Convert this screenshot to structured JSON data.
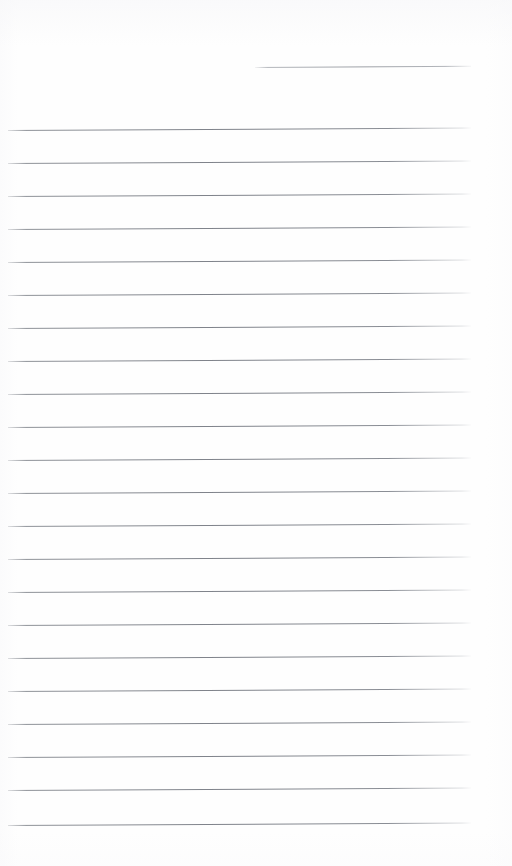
{
  "document": {
    "type": "lined-notebook-page",
    "title": "Blank ruled notebook page",
    "description": "Scanned blank lined paper with horizontal ruling lines and no written content",
    "page_width": 512,
    "page_height": 866,
    "background_color": "#fefefe",
    "rule_color": "#82868e",
    "rule_thickness_px": 1,
    "rule_spacing_px": 33,
    "left_margin_px": 8,
    "right_margin_px": 41,
    "top_margin_px": 67,
    "bottom_margin_px": 41,
    "skew_degrees": -0.3,
    "text_content": "",
    "rule_count": 24,
    "rules": [
      {
        "index": 1,
        "y": 67,
        "x_start": 255,
        "x_end": 471,
        "partial": true
      },
      {
        "index": 2,
        "y": 130,
        "x_start": 8,
        "x_end": 471,
        "partial": false
      },
      {
        "index": 3,
        "y": 163,
        "x_start": 8,
        "x_end": 471,
        "partial": false
      },
      {
        "index": 4,
        "y": 196,
        "x_start": 8,
        "x_end": 471,
        "partial": false
      },
      {
        "index": 5,
        "y": 229,
        "x_start": 8,
        "x_end": 471,
        "partial": false
      },
      {
        "index": 6,
        "y": 262,
        "x_start": 8,
        "x_end": 471,
        "partial": false
      },
      {
        "index": 7,
        "y": 295,
        "x_start": 8,
        "x_end": 471,
        "partial": false
      },
      {
        "index": 8,
        "y": 328,
        "x_start": 8,
        "x_end": 471,
        "partial": false
      },
      {
        "index": 9,
        "y": 361,
        "x_start": 8,
        "x_end": 471,
        "partial": false
      },
      {
        "index": 10,
        "y": 394,
        "x_start": 8,
        "x_end": 471,
        "partial": false
      },
      {
        "index": 11,
        "y": 427,
        "x_start": 8,
        "x_end": 471,
        "partial": false
      },
      {
        "index": 12,
        "y": 460,
        "x_start": 8,
        "x_end": 471,
        "partial": false
      },
      {
        "index": 13,
        "y": 493,
        "x_start": 8,
        "x_end": 471,
        "partial": false
      },
      {
        "index": 14,
        "y": 526,
        "x_start": 8,
        "x_end": 471,
        "partial": false
      },
      {
        "index": 15,
        "y": 559,
        "x_start": 8,
        "x_end": 471,
        "partial": false
      },
      {
        "index": 16,
        "y": 592,
        "x_start": 8,
        "x_end": 471,
        "partial": false
      },
      {
        "index": 17,
        "y": 625,
        "x_start": 8,
        "x_end": 471,
        "partial": false
      },
      {
        "index": 18,
        "y": 658,
        "x_start": 8,
        "x_end": 471,
        "partial": false
      },
      {
        "index": 19,
        "y": 691,
        "x_start": 8,
        "x_end": 471,
        "partial": false
      },
      {
        "index": 20,
        "y": 724,
        "x_start": 8,
        "x_end": 471,
        "partial": false
      },
      {
        "index": 21,
        "y": 757,
        "x_start": 8,
        "x_end": 471,
        "partial": false
      },
      {
        "index": 22,
        "y": 790,
        "x_start": 8,
        "x_end": 471,
        "partial": false
      },
      {
        "index": 23,
        "y": 825,
        "x_start": 8,
        "x_end": 471,
        "partial": false
      }
    ]
  }
}
